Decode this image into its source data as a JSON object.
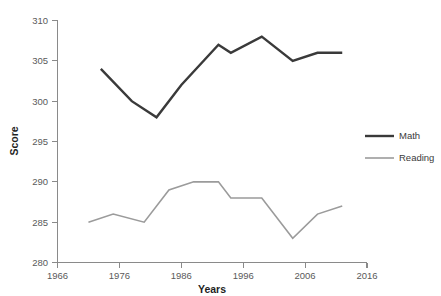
{
  "chart_data": {
    "type": "line",
    "title": "",
    "xlabel": "Years",
    "ylabel": "Score",
    "xlim": [
      1966,
      2016
    ],
    "ylim": [
      280,
      310
    ],
    "grid": false,
    "legend_position": "right",
    "x_ticks": [
      "1966",
      "1976",
      "1986",
      "1996",
      "2006",
      "2016"
    ],
    "y_ticks": [
      "280",
      "285",
      "290",
      "295",
      "300",
      "305",
      "310"
    ],
    "series": [
      {
        "name": "Math",
        "color": "#3a3a3a",
        "x": [
          1973,
          1978,
          1982,
          1986,
          1992,
          1994,
          1999,
          2004,
          2008,
          2012
        ],
        "values": [
          304,
          300,
          298,
          302,
          307,
          306,
          308,
          305,
          306,
          306
        ]
      },
      {
        "name": "Reading",
        "color": "#9b9b9b",
        "x": [
          1971,
          1975,
          1980,
          1984,
          1988,
          1992,
          1994,
          1999,
          2004,
          2008,
          2012
        ],
        "values": [
          285,
          286,
          285,
          289,
          290,
          290,
          288,
          288,
          283,
          286,
          287
        ]
      }
    ]
  },
  "legend": {
    "items": [
      {
        "label": "Math",
        "color": "#3a3a3a"
      },
      {
        "label": "Reading",
        "color": "#9b9b9b"
      }
    ]
  },
  "axes": {
    "x_title": "Years",
    "y_title": "Score"
  }
}
